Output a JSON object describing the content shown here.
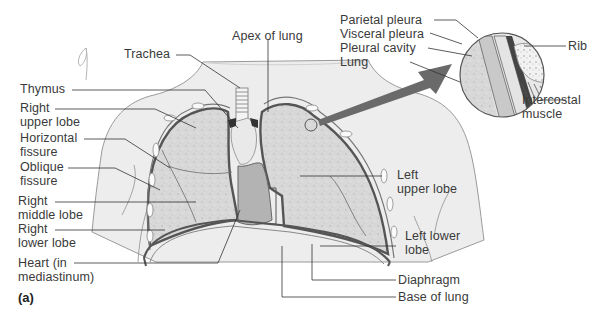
{
  "figure": {
    "panel_label": "(a)",
    "colors": {
      "background": "#ffffff",
      "body_skin": "#ececec",
      "lung_tissue": "#d6d6d6",
      "heart": "#b3b3b3",
      "pleura_line": "#555555",
      "arrow": "#6a6a6a",
      "label_text": "#3a3a3a"
    }
  },
  "labels_left": [
    {
      "id": "trachea",
      "text": "Trachea"
    },
    {
      "id": "thymus",
      "text": "Thymus"
    },
    {
      "id": "right-upper-lobe",
      "text": "Right\nupper lobe"
    },
    {
      "id": "horizontal-fissure",
      "text": "Horizontal\nfissure"
    },
    {
      "id": "oblique-fissure",
      "text": "Oblique\nfissure"
    },
    {
      "id": "right-middle-lobe",
      "text": "Right\nmiddle lobe"
    },
    {
      "id": "right-lower-lobe",
      "text": "Right\nlower lobe"
    },
    {
      "id": "heart",
      "text": "Heart (in\nmediastinum)"
    }
  ],
  "labels_top": [
    {
      "id": "apex-of-lung",
      "text": "Apex of lung"
    }
  ],
  "labels_right": [
    {
      "id": "left-upper-lobe",
      "text": "Left\nupper lobe"
    },
    {
      "id": "left-lower-lobe",
      "text": "Left lower\nlobe"
    },
    {
      "id": "diaphragm",
      "text": "Diaphragm"
    },
    {
      "id": "base-of-lung",
      "text": "Base of lung"
    }
  ],
  "inset": {
    "labels_left": [
      {
        "id": "parietal-pleura",
        "text": "Parietal pleura"
      },
      {
        "id": "visceral-pleura",
        "text": "Visceral pleura"
      },
      {
        "id": "pleural-cavity",
        "text": "Pleural cavity"
      },
      {
        "id": "lung",
        "text": "Lung"
      }
    ],
    "labels_right": [
      {
        "id": "rib",
        "text": "Rib"
      },
      {
        "id": "intercostal-muscle",
        "text": "Intercostal\nmuscle"
      }
    ]
  }
}
